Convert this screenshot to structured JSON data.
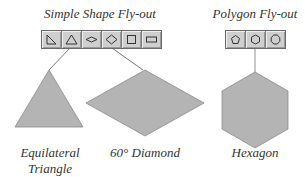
{
  "simple_flyout": {
    "title": "Simple Shape Fly-out",
    "buttons": [
      {
        "icon": "right-triangle-icon"
      },
      {
        "icon": "triangle-icon"
      },
      {
        "icon": "flat-diamond-icon"
      },
      {
        "icon": "diamond-icon"
      },
      {
        "icon": "square-icon"
      },
      {
        "icon": "rectangle-icon"
      }
    ]
  },
  "polygon_flyout": {
    "title": "Polygon Fly-out",
    "buttons": [
      {
        "icon": "pentagon-icon"
      },
      {
        "icon": "hexagon-icon"
      },
      {
        "icon": "octagon-icon"
      }
    ]
  },
  "shapes": {
    "triangle": {
      "label_line1": "Equilateral",
      "label_line2": "Triangle"
    },
    "diamond": {
      "label": "60° Diamond"
    },
    "hexagon": {
      "label": "Hexagon"
    }
  },
  "colors": {
    "shape_fill": "#b4b4b4",
    "shape_stroke": "#8a8a8a",
    "toolbar_bg": "#cfcfcf"
  }
}
